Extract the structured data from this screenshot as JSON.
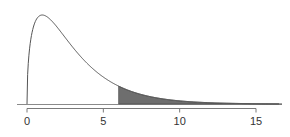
{
  "chart_data": {
    "type": "area",
    "title": "",
    "xlabel": "",
    "ylabel": "",
    "distribution": "chi-square",
    "df": 3,
    "xlim": [
      0,
      15
    ],
    "x_ticks": [
      0,
      5,
      10,
      15
    ],
    "x_tick_labels": [
      "0",
      "5",
      "10",
      "15"
    ],
    "shaded_region": {
      "from": 6,
      "to": 16.5,
      "tail": "upper"
    },
    "grid": false,
    "legend": null
  },
  "colors": {
    "curve": "#555555",
    "shade": "#6e6e6e",
    "axis": "#7a7a7a",
    "baseline": "#8a8a8a"
  }
}
